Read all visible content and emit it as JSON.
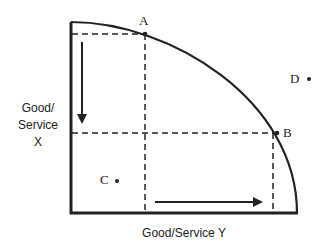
{
  "diagram": {
    "type": "production-possibilities-frontier",
    "y_axis_label_lines": [
      "Good/",
      "Service",
      "X"
    ],
    "x_axis_label": "Good/Service Y",
    "points": {
      "A": {
        "label": "A",
        "position": "on-frontier"
      },
      "B": {
        "label": "B",
        "position": "on-frontier"
      },
      "C": {
        "label": "C",
        "position": "inside-frontier"
      },
      "D": {
        "label": "D",
        "position": "outside-frontier"
      }
    },
    "arrows": [
      {
        "name": "decrease-x",
        "direction": "down"
      },
      {
        "name": "increase-y",
        "direction": "right"
      }
    ],
    "colors": {
      "line": "#222222",
      "background": "#ffffff"
    }
  }
}
